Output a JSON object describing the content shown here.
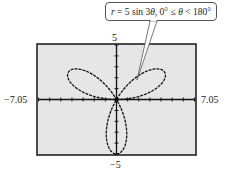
{
  "callout": {
    "var_r": "r",
    "equation_rest": " = 5 sin 3",
    "theta": "θ",
    "domain_text": ", 0° ≤ ",
    "theta2": "θ",
    "domain_end": " < 180°"
  },
  "window": {
    "xmin_label": "−7.05",
    "xmax_label": "7.05",
    "ymin_label": "−5",
    "ymax_label": "5"
  },
  "colors": {
    "plot_background": "#e6e6e6",
    "curve": "#111111",
    "frame": "#222222"
  },
  "chart_data": {
    "type": "line",
    "title": "r = 5 sin 3θ, 0° ≤ θ < 180°",
    "subtype": "polar rose curve",
    "equation": "r = 5 sin 3θ",
    "theta_range_deg": [
      0,
      180
    ],
    "xlim": [
      -7.05,
      7.05
    ],
    "ylim": [
      -5,
      5
    ],
    "xlabel": "",
    "ylabel": "",
    "tick_labels": {
      "x": [
        "−7.05",
        "7.05"
      ],
      "y": [
        "−5",
        "5"
      ]
    },
    "x_tick_spacing": 1,
    "y_tick_spacing": 1,
    "grid": false,
    "petals": [
      {
        "angle_deg": 30,
        "length": 5
      },
      {
        "angle_deg": 150,
        "length": 5
      },
      {
        "angle_deg": 270,
        "length": 5
      }
    ],
    "annotation": "r = 5 sin 3θ, 0° ≤ θ < 180°"
  }
}
